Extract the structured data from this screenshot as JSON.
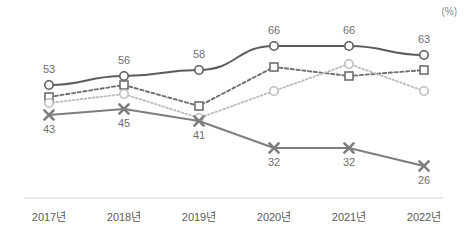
{
  "unit": "(%)",
  "axis": {
    "categories": [
      "2017년",
      "2018년",
      "2019년",
      "2020년",
      "2021년",
      "2022년"
    ]
  },
  "colors": {
    "series_solid_dark": "#5c5c5c",
    "series_dashed_dark": "#6e6e6e",
    "series_dotted_light": "#bdbdbd",
    "series_cross_gray": "#7d7d7d",
    "label_text": "#6e6e6e",
    "tick_text": "#5a5a5a",
    "axis_line": "#e2e2e2",
    "unit_text": "#8a8a8a"
  },
  "chart_data": {
    "type": "line",
    "title": "",
    "subtitle": "",
    "xlabel": "",
    "ylabel": "",
    "unit": "(%)",
    "grid": false,
    "legend": "none",
    "ylim": [
      0,
      70
    ],
    "categories": [
      "2017년",
      "2018년",
      "2019년",
      "2020년",
      "2021년",
      "2022년"
    ],
    "series": [
      {
        "name": "series-1",
        "style": "solid",
        "marker": "circle-open",
        "color": "#5c5c5c",
        "labeled": true,
        "values": [
          53,
          56,
          58,
          66,
          66,
          63
        ],
        "labels": [
          "53",
          "56",
          "58",
          "66",
          "66",
          "63"
        ]
      },
      {
        "name": "series-2",
        "style": "dashed",
        "marker": "square-open",
        "color": "#6e6e6e",
        "labeled": false,
        "values": [
          49,
          53,
          46,
          59,
          56,
          58
        ],
        "labels": [
          "",
          "",
          "",
          "",
          "",
          ""
        ]
      },
      {
        "name": "series-3",
        "style": "dotted",
        "marker": "circle-open",
        "color": "#bdbdbd",
        "labeled": false,
        "values": [
          47,
          50,
          42,
          51,
          60,
          51
        ],
        "labels": [
          "",
          "",
          "",
          "",
          "",
          ""
        ]
      },
      {
        "name": "series-4",
        "style": "solid",
        "marker": "cross",
        "color": "#7d7d7d",
        "labeled": true,
        "values": [
          43,
          45,
          41,
          32,
          32,
          26
        ],
        "labels": [
          "43",
          "45",
          "41",
          "32",
          "32",
          "26"
        ]
      }
    ],
    "point_label_positions": [
      {
        "series": 0,
        "index": 0,
        "pos": "above"
      },
      {
        "series": 0,
        "index": 1,
        "pos": "above"
      },
      {
        "series": 0,
        "index": 2,
        "pos": "above"
      },
      {
        "series": 0,
        "index": 3,
        "pos": "above"
      },
      {
        "series": 0,
        "index": 4,
        "pos": "above"
      },
      {
        "series": 0,
        "index": 5,
        "pos": "above"
      },
      {
        "series": 3,
        "index": 0,
        "pos": "below"
      },
      {
        "series": 3,
        "index": 1,
        "pos": "below"
      },
      {
        "series": 3,
        "index": 2,
        "pos": "below"
      },
      {
        "series": 3,
        "index": 3,
        "pos": "below"
      },
      {
        "series": 3,
        "index": 4,
        "pos": "below"
      },
      {
        "series": 3,
        "index": 5,
        "pos": "below"
      }
    ]
  }
}
